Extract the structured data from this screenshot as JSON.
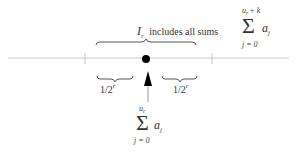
{
  "diagram": {
    "interval_label": {
      "symbol": "I",
      "symbol_subscript": "r",
      "text": "includes all sums"
    },
    "upper_sum": {
      "operator": "Σ",
      "upper_limit_var": "u",
      "upper_limit_sub": "r",
      "upper_limit_rest": "+ k",
      "lower_limit": "j = 0",
      "term": "a",
      "term_subscript": "j"
    },
    "left_bracket_label": {
      "base": "1/2",
      "exponent": "r"
    },
    "right_bracket_label": {
      "base": "1/2",
      "exponent": "r"
    },
    "point_sum": {
      "operator": "Σ",
      "upper_limit_var": "u",
      "upper_limit_sub": "r",
      "lower_limit": "j = 0",
      "term": "a",
      "term_subscript": "j"
    },
    "colors": {
      "line": "#bbbbbb",
      "brace": "#555555",
      "dot": "#000000",
      "arrow": "#000000",
      "arrow_stem": "#999999"
    }
  }
}
